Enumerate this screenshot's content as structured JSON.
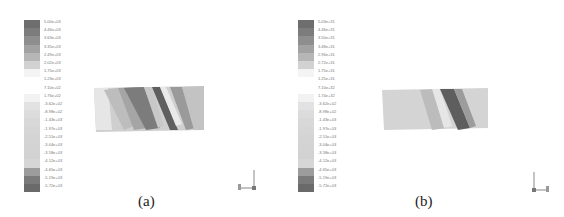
{
  "panels": [
    {
      "id": "a",
      "caption": "(a)",
      "legend": {
        "labels": [
          "5.00e+03",
          "4.46e+03",
          "3.63e+03",
          "3.35e+03",
          "2.49e+03",
          "2.02e+03",
          "1.75e+03",
          "1.23e+03",
          "7.10e+02",
          "1.76e+02",
          "-3.62e+02",
          "-8.98e+02",
          "-1.43e+03",
          "-1.97e+03",
          "-2.51e+03",
          "-3.04e+03",
          "-3.58e+03",
          "-4.12e+03",
          "-4.65e+03",
          "-5.19e+03",
          "-5.72e+03"
        ],
        "colors": [
          "#6e6e6e",
          "#7c7c7c",
          "#8e8e8e",
          "#a2a2a2",
          "#b6b6b6",
          "#d2d2d2",
          "#f4f4f4",
          "#ffffff",
          "#ffffff",
          "#f2f2f2",
          "#e2e2e2",
          "#dcdcdc",
          "#d8d8d8",
          "#d6d6d6",
          "#d4d4d4",
          "#d3d3d3",
          "#d2d2d2",
          "#d6d6d6",
          "#9c9c9c",
          "#7a7a7a",
          "#6a6a6a"
        ]
      },
      "axis_triad": {
        "x": "x",
        "y": "y",
        "z": "z"
      }
    },
    {
      "id": "b",
      "caption": "(b)",
      "legend": {
        "labels": [
          "5.03e+31",
          "4.46e+31",
          "3.50e+31",
          "3.48e+31",
          "2.96e+31",
          "2.72e+31",
          "1.75e+31",
          "1.25e+31",
          "7.10e+32",
          "1.74e+32",
          "-3.62e+02",
          "-8.98e+02",
          "-1.43e+03",
          "-1.97e+03",
          "-2.51e+03",
          "-3.04e+03",
          "-3.58e+03",
          "-4.12e+03",
          "-4.65e+03",
          "-5.19e+03",
          "-5.72e+03"
        ],
        "colors": [
          "#6e6e6e",
          "#7c7c7c",
          "#8e8e8e",
          "#a2a2a2",
          "#b6b6b6",
          "#d2d2d2",
          "#f4f4f4",
          "#ffffff",
          "#ffffff",
          "#f2f2f2",
          "#e2e2e2",
          "#dcdcdc",
          "#d8d8d8",
          "#d6d6d6",
          "#d4d4d4",
          "#d3d3d3",
          "#d2d2d2",
          "#d6d6d6",
          "#9c9c9c",
          "#7a7a7a",
          "#6a6a6a"
        ]
      },
      "axis_triad": {
        "x": "x",
        "y": "y",
        "z": "z"
      }
    }
  ]
}
